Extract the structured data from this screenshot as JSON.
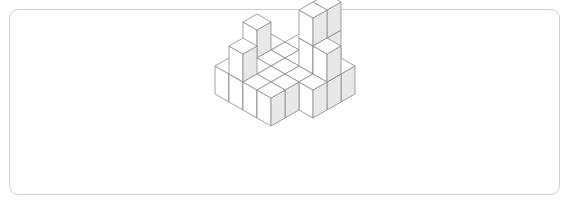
{
  "canvas": {
    "width": 571,
    "height": 206,
    "background": "#ffffff"
  },
  "frame": {
    "x": 9,
    "y": 9,
    "width": 551,
    "height": 186,
    "border_color": "#cfcfcf",
    "border_radius": 9,
    "fill": "#ffffff"
  },
  "figure": {
    "kind": "isometric-voxel-stack",
    "origin": {
      "x": 285,
      "y": 54
    },
    "cube": {
      "half_width": 14,
      "half_depth": 8,
      "height": 28
    },
    "style": {
      "stroke": "#8a8a8a",
      "stroke_width": 0.8,
      "face_top": "#ffffff",
      "face_left": "#ffffff",
      "face_right": "#e8e8e8"
    },
    "grid": {
      "cols": 5,
      "rows": 5,
      "col_label": "x axis (to lower-right)",
      "row_label": "y axis (to lower-left)",
      "heights": [
        [
          0,
          1,
          1,
          3,
          1
        ],
        [
          1,
          1,
          1,
          3,
          2
        ],
        [
          2,
          1,
          1,
          1,
          1
        ],
        [
          1,
          1,
          1,
          1,
          0
        ],
        [
          1,
          2,
          1,
          1,
          0
        ]
      ]
    },
    "cube_count": 38
  }
}
